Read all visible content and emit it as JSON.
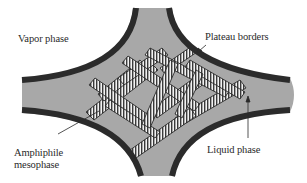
{
  "diagram": {
    "type": "schematic cross-section of a foam Plateau border junction",
    "labels": {
      "vapor_phase": "Vapor phase",
      "plateau_borders": "Plateau borders",
      "liquid_phase": "Liquid phase",
      "amphiphile_mesophase_line1": "Amphiphile",
      "amphiphile_mesophase_line2": "mesophase"
    },
    "colors": {
      "background": "#ffffff",
      "liquid_fill": "#a8a8a8",
      "border_stroke": "#2b2b2b",
      "hatch_light": "#f2f2f2",
      "hatch_dark": "#3a3a3a",
      "text": "#2a2a2a"
    },
    "elements": [
      {
        "id": "vapor-phase-region",
        "description": "white exterior regions in the four corners"
      },
      {
        "id": "plateau-border-walls",
        "description": "four dark concave curved walls forming a four-armed junction"
      },
      {
        "id": "liquid-phase-channel",
        "description": "grey liquid filling the junction and four arms"
      },
      {
        "id": "mesophase-lamellae",
        "description": "striped (hatched) elongated bars randomly stacked in the centre"
      }
    ],
    "arrows": [
      {
        "from_label": "plateau_borders",
        "points_to": "upper-right plateau border wall"
      },
      {
        "from_label": "liquid_phase",
        "points_to": "grey liquid in right arm"
      },
      {
        "from_label": "amphiphile_mesophase",
        "points_to": "hatched lamella at lower-left"
      }
    ]
  }
}
